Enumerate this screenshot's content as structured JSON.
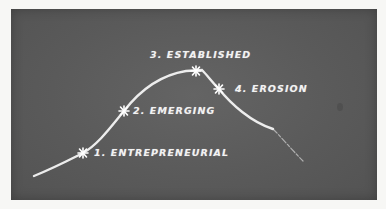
{
  "diagram": {
    "type": "lifecycle-curve",
    "style": "chalkboard",
    "colors": {
      "board": "#5a5a5a",
      "chalk": "#f2f2f2",
      "page": "#f7f7f5"
    },
    "stages": [
      {
        "label": "1. ENTREPRENEURIAL",
        "marker": "star-icon"
      },
      {
        "label": "2. EMERGING",
        "marker": "star-icon"
      },
      {
        "label": "3. ESTABLISHED",
        "marker": "star-icon"
      },
      {
        "label": "4. EROSION",
        "marker": "star-icon"
      }
    ]
  }
}
